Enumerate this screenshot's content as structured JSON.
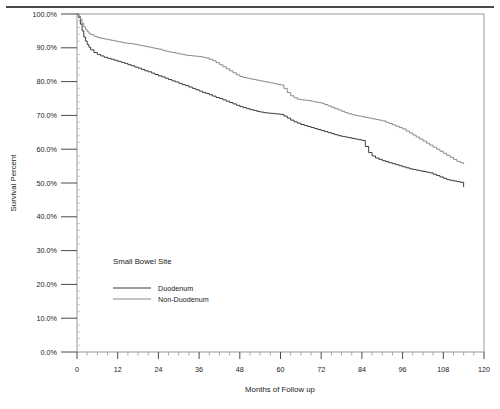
{
  "chart_data": {
    "type": "line",
    "title": "",
    "xlabel": "Months of Follow up",
    "ylabel": "Survival Percent",
    "xlim": [
      0,
      120
    ],
    "ylim": [
      0,
      100
    ],
    "grid": false,
    "x_ticks": [
      0,
      12,
      24,
      36,
      48,
      60,
      72,
      84,
      96,
      108,
      120
    ],
    "x_tick_labels": [
      "0",
      "12",
      "24",
      "36",
      "48",
      "60",
      "72",
      "84",
      "96",
      "108",
      "120"
    ],
    "x_minor_tick_step": 3,
    "y_ticks": [
      0,
      10,
      20,
      30,
      40,
      50,
      60,
      70,
      80,
      90,
      100
    ],
    "y_tick_labels": [
      "0.0%",
      "10.0%",
      "20.0%",
      "30.0%",
      "40.0%",
      "50.0%",
      "60.0%",
      "70.0%",
      "80.0%",
      "90.0%",
      "100.0%"
    ],
    "y_minor_tick_step": 2,
    "legend": {
      "title": "Small Bowel Site",
      "position": "inside-lower-left",
      "entries": [
        {
          "name": "Duodenum",
          "color": "#3a3a3a"
        },
        {
          "name": "Non-Duodenum",
          "color": "#8a8a8a"
        }
      ]
    },
    "series": [
      {
        "name": "Duodenum",
        "color": "#3a3a3a",
        "step": "post",
        "points": [
          [
            0,
            100.0
          ],
          [
            0.5,
            99.0
          ],
          [
            1,
            97.0
          ],
          [
            1.5,
            95.0
          ],
          [
            2,
            93.2
          ],
          [
            2.5,
            92.0
          ],
          [
            3,
            91.0
          ],
          [
            3.5,
            90.2
          ],
          [
            4,
            89.4
          ],
          [
            5,
            88.6
          ],
          [
            6,
            88.0
          ],
          [
            7,
            87.6
          ],
          [
            8,
            87.2
          ],
          [
            9,
            86.9
          ],
          [
            10,
            86.6
          ],
          [
            11,
            86.3
          ],
          [
            12,
            86.0
          ],
          [
            13,
            85.7
          ],
          [
            14,
            85.4
          ],
          [
            15,
            85.0
          ],
          [
            16,
            84.7
          ],
          [
            17,
            84.3
          ],
          [
            18,
            84.0
          ],
          [
            19,
            83.6
          ],
          [
            20,
            83.2
          ],
          [
            21,
            82.9
          ],
          [
            22,
            82.5
          ],
          [
            23,
            82.1
          ],
          [
            24,
            81.7
          ],
          [
            25,
            81.4
          ],
          [
            26,
            81.0
          ],
          [
            27,
            80.6
          ],
          [
            28,
            80.2
          ],
          [
            29,
            79.9
          ],
          [
            30,
            79.5
          ],
          [
            31,
            79.1
          ],
          [
            32,
            78.8
          ],
          [
            33,
            78.4
          ],
          [
            34,
            78.0
          ],
          [
            35,
            77.6
          ],
          [
            36,
            77.2
          ],
          [
            37,
            76.8
          ],
          [
            38,
            76.5
          ],
          [
            39,
            76.1
          ],
          [
            40,
            75.7
          ],
          [
            41,
            75.3
          ],
          [
            42,
            75.0
          ],
          [
            43,
            74.6
          ],
          [
            44,
            74.2
          ],
          [
            45,
            73.8
          ],
          [
            46,
            73.4
          ],
          [
            47,
            73.0
          ],
          [
            48,
            72.6
          ],
          [
            49,
            72.3
          ],
          [
            50,
            72.0
          ],
          [
            51,
            71.7
          ],
          [
            52,
            71.5
          ],
          [
            53,
            71.2
          ],
          [
            54,
            71.0
          ],
          [
            55,
            70.8
          ],
          [
            56,
            70.7
          ],
          [
            57,
            70.6
          ],
          [
            58,
            70.5
          ],
          [
            59,
            70.4
          ],
          [
            60,
            70.3
          ],
          [
            61,
            69.8
          ],
          [
            62,
            69.2
          ],
          [
            63,
            68.6
          ],
          [
            64,
            68.1
          ],
          [
            65,
            67.7
          ],
          [
            66,
            67.3
          ],
          [
            67,
            67.0
          ],
          [
            68,
            66.7
          ],
          [
            69,
            66.4
          ],
          [
            70,
            66.1
          ],
          [
            71,
            65.8
          ],
          [
            72,
            65.5
          ],
          [
            73,
            65.2
          ],
          [
            74,
            64.9
          ],
          [
            75,
            64.6
          ],
          [
            76,
            64.3
          ],
          [
            77,
            64.0
          ],
          [
            78,
            63.8
          ],
          [
            79,
            63.6
          ],
          [
            80,
            63.4
          ],
          [
            81,
            63.2
          ],
          [
            82,
            63.0
          ],
          [
            83,
            62.8
          ],
          [
            84,
            62.6
          ],
          [
            85,
            60.8
          ],
          [
            86,
            59.0
          ],
          [
            87,
            58.0
          ],
          [
            88,
            57.4
          ],
          [
            89,
            57.0
          ],
          [
            90,
            56.6
          ],
          [
            91,
            56.3
          ],
          [
            92,
            56.0
          ],
          [
            93,
            55.7
          ],
          [
            94,
            55.4
          ],
          [
            95,
            55.1
          ],
          [
            96,
            54.8
          ],
          [
            97,
            54.5
          ],
          [
            98,
            54.2
          ],
          [
            99,
            54.0
          ],
          [
            100,
            53.8
          ],
          [
            101,
            53.6
          ],
          [
            102,
            53.4
          ],
          [
            103,
            53.2
          ],
          [
            104,
            53.0
          ],
          [
            105,
            52.6
          ],
          [
            106,
            52.2
          ],
          [
            107,
            51.8
          ],
          [
            108,
            51.4
          ],
          [
            109,
            51.0
          ],
          [
            110,
            50.8
          ],
          [
            111,
            50.6
          ],
          [
            112,
            50.4
          ],
          [
            113,
            50.2
          ],
          [
            114,
            48.8
          ]
        ]
      },
      {
        "name": "Non-Duodenum",
        "color": "#8a8a8a",
        "step": "post",
        "points": [
          [
            0,
            100.0
          ],
          [
            0.5,
            99.4
          ],
          [
            1,
            98.4
          ],
          [
            1.5,
            97.2
          ],
          [
            2,
            96.2
          ],
          [
            2.5,
            95.4
          ],
          [
            3,
            94.8
          ],
          [
            3.5,
            94.3
          ],
          [
            4,
            93.9
          ],
          [
            5,
            93.4
          ],
          [
            6,
            93.0
          ],
          [
            7,
            92.8
          ],
          [
            8,
            92.6
          ],
          [
            9,
            92.4
          ],
          [
            10,
            92.2
          ],
          [
            11,
            92.0
          ],
          [
            12,
            91.8
          ],
          [
            13,
            91.6
          ],
          [
            14,
            91.4
          ],
          [
            15,
            91.3
          ],
          [
            16,
            91.2
          ],
          [
            17,
            91.0
          ],
          [
            18,
            90.8
          ],
          [
            19,
            90.6
          ],
          [
            20,
            90.4
          ],
          [
            21,
            90.2
          ],
          [
            22,
            90.0
          ],
          [
            23,
            89.8
          ],
          [
            24,
            89.6
          ],
          [
            25,
            89.3
          ],
          [
            26,
            89.0
          ],
          [
            27,
            88.8
          ],
          [
            28,
            88.6
          ],
          [
            29,
            88.4
          ],
          [
            30,
            88.2
          ],
          [
            31,
            88.0
          ],
          [
            32,
            87.8
          ],
          [
            33,
            87.7
          ],
          [
            34,
            87.6
          ],
          [
            35,
            87.5
          ],
          [
            36,
            87.4
          ],
          [
            37,
            87.2
          ],
          [
            38,
            87.0
          ],
          [
            39,
            86.6
          ],
          [
            40,
            86.2
          ],
          [
            41,
            85.6
          ],
          [
            42,
            85.0
          ],
          [
            43,
            84.4
          ],
          [
            44,
            83.8
          ],
          [
            45,
            83.2
          ],
          [
            46,
            82.6
          ],
          [
            47,
            82.0
          ],
          [
            48,
            81.5
          ],
          [
            49,
            81.2
          ],
          [
            50,
            81.0
          ],
          [
            51,
            80.8
          ],
          [
            52,
            80.6
          ],
          [
            53,
            80.4
          ],
          [
            54,
            80.2
          ],
          [
            55,
            80.0
          ],
          [
            56,
            79.8
          ],
          [
            57,
            79.6
          ],
          [
            58,
            79.4
          ],
          [
            59,
            79.2
          ],
          [
            60,
            79.0
          ],
          [
            61,
            78.0
          ],
          [
            62,
            76.8
          ],
          [
            63,
            75.8
          ],
          [
            64,
            75.2
          ],
          [
            65,
            74.8
          ],
          [
            66,
            74.6
          ],
          [
            67,
            74.5
          ],
          [
            68,
            74.4
          ],
          [
            69,
            74.2
          ],
          [
            70,
            74.0
          ],
          [
            71,
            73.8
          ],
          [
            72,
            73.6
          ],
          [
            73,
            73.2
          ],
          [
            74,
            72.8
          ],
          [
            75,
            72.4
          ],
          [
            76,
            72.0
          ],
          [
            77,
            71.6
          ],
          [
            78,
            71.2
          ],
          [
            79,
            70.8
          ],
          [
            80,
            70.5
          ],
          [
            81,
            70.2
          ],
          [
            82,
            70.0
          ],
          [
            83,
            69.8
          ],
          [
            84,
            69.6
          ],
          [
            85,
            69.4
          ],
          [
            86,
            69.2
          ],
          [
            87,
            69.0
          ],
          [
            88,
            68.8
          ],
          [
            89,
            68.6
          ],
          [
            90,
            68.4
          ],
          [
            91,
            68.0
          ],
          [
            92,
            67.6
          ],
          [
            93,
            67.2
          ],
          [
            94,
            66.8
          ],
          [
            95,
            66.4
          ],
          [
            96,
            66.0
          ],
          [
            97,
            65.4
          ],
          [
            98,
            64.8
          ],
          [
            99,
            64.2
          ],
          [
            100,
            63.6
          ],
          [
            101,
            63.0
          ],
          [
            102,
            62.4
          ],
          [
            103,
            61.8
          ],
          [
            104,
            61.2
          ],
          [
            105,
            60.6
          ],
          [
            106,
            60.0
          ],
          [
            107,
            59.4
          ],
          [
            108,
            58.8
          ],
          [
            109,
            58.2
          ],
          [
            110,
            57.6
          ],
          [
            111,
            57.0
          ],
          [
            112,
            56.4
          ],
          [
            113,
            56.0
          ],
          [
            114,
            55.6
          ]
        ]
      }
    ]
  }
}
